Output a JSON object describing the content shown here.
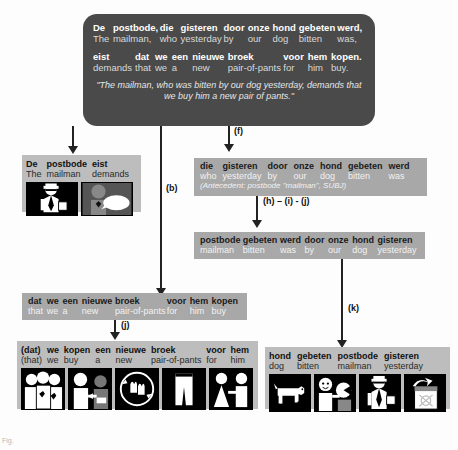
{
  "figure": {
    "caption": "Fig."
  },
  "top_box": {
    "name": "source-sentence-box",
    "line1": [
      {
        "src": "De",
        "tgt": "The"
      },
      {
        "src": "postbode,",
        "tgt": "mailman,"
      },
      {
        "src": "die",
        "tgt": "who"
      },
      {
        "src": "gisteren",
        "tgt": "yesterday"
      },
      {
        "src": "door",
        "tgt": "by"
      },
      {
        "src": "onze",
        "tgt": "our"
      },
      {
        "src": "hond",
        "tgt": "dog"
      },
      {
        "src": "gebeten",
        "tgt": "bitten"
      },
      {
        "src": "werd,",
        "tgt": "was,"
      }
    ],
    "line2": [
      {
        "src": "eist",
        "tgt": "demands"
      },
      {
        "src": "dat",
        "tgt": "that"
      },
      {
        "src": "we",
        "tgt": "we"
      },
      {
        "src": "een",
        "tgt": "a"
      },
      {
        "src": "nieuwe",
        "tgt": "new"
      },
      {
        "src": "broek",
        "tgt": "pair-of-pants"
      },
      {
        "src": "voor",
        "tgt": "for"
      },
      {
        "src": "hem",
        "tgt": "him"
      },
      {
        "src": "kopen.",
        "tgt": "buy."
      }
    ],
    "translation": "\"The mailman, who was bitten by our dog yesterday, demands that we buy him a new pair of pants.\""
  },
  "box_mailman_demands": {
    "name": "mailman-demands-panel",
    "words": [
      {
        "src": "De",
        "tgt": "The"
      },
      {
        "src": "postbode",
        "tgt": "mailman"
      },
      {
        "src": "eist",
        "tgt": "demands"
      }
    ],
    "pictograms": [
      {
        "name": "mailman-pictogram",
        "glyph": "mailman"
      },
      {
        "name": "demand-speech-pictogram",
        "glyph": "demand"
      }
    ]
  },
  "box_relative_clause": {
    "name": "relative-clause-box",
    "words": [
      {
        "src": "die",
        "tgt": "who"
      },
      {
        "src": "gisteren",
        "tgt": "yesterday"
      },
      {
        "src": "door",
        "tgt": "by"
      },
      {
        "src": "onze",
        "tgt": "our"
      },
      {
        "src": "hond",
        "tgt": "dog"
      },
      {
        "src": "gebeten",
        "tgt": "bitten"
      },
      {
        "src": "werd",
        "tgt": "was"
      }
    ],
    "note": "(Antecedent: postbode \"mailman\", SUBJ)"
  },
  "box_passive_reordered": {
    "name": "passive-reordered-box",
    "words": [
      {
        "src": "postbode",
        "tgt": "mailman"
      },
      {
        "src": "gebeten",
        "tgt": "bitten"
      },
      {
        "src": "werd",
        "tgt": "was"
      },
      {
        "src": "door",
        "tgt": "by"
      },
      {
        "src": "onze",
        "tgt": "our"
      },
      {
        "src": "hond",
        "tgt": "dog"
      },
      {
        "src": "gisteren",
        "tgt": "yesterday"
      }
    ]
  },
  "box_subclause": {
    "name": "subordinate-clause-box",
    "words": [
      {
        "src": "dat",
        "tgt": "that"
      },
      {
        "src": "we",
        "tgt": "we"
      },
      {
        "src": "een",
        "tgt": "a"
      },
      {
        "src": "nieuwe",
        "tgt": "new"
      },
      {
        "src": "broek",
        "tgt": "pair-of-pants"
      },
      {
        "src": "voor",
        "tgt": "for"
      },
      {
        "src": "hem",
        "tgt": "him"
      },
      {
        "src": "kopen",
        "tgt": "buy"
      }
    ]
  },
  "box_we_buy": {
    "name": "we-buy-pants-panel",
    "words": [
      {
        "src": "(dat)",
        "tgt": "(that)"
      },
      {
        "src": "we",
        "tgt": "we"
      },
      {
        "src": "kopen",
        "tgt": "buy"
      },
      {
        "src": "een",
        "tgt": "a"
      },
      {
        "src": "nieuwe",
        "tgt": "new"
      },
      {
        "src": "broek",
        "tgt": "pair-of-pants"
      },
      {
        "src": "voor",
        "tgt": "for"
      },
      {
        "src": "hem",
        "tgt": "him"
      }
    ],
    "pictograms": [
      {
        "name": "group-of-people-pictogram",
        "glyph": "we"
      },
      {
        "name": "buy-give-pictogram",
        "glyph": "buy"
      },
      {
        "name": "exchange-hands-pictogram",
        "glyph": "exchange"
      },
      {
        "name": "pants-pictogram",
        "glyph": "pants"
      },
      {
        "name": "for-him-pictogram",
        "glyph": "forhim"
      }
    ]
  },
  "box_dog_bit": {
    "name": "dog-bit-mailman-panel",
    "words": [
      {
        "src": "hond",
        "tgt": "dog"
      },
      {
        "src": "gebeten",
        "tgt": "bitten"
      },
      {
        "src": "postbode",
        "tgt": "mailman"
      },
      {
        "src": "gisteren",
        "tgt": "yesterday"
      }
    ],
    "pictograms": [
      {
        "name": "dog-pictogram",
        "glyph": "dog"
      },
      {
        "name": "bite-pictogram",
        "glyph": "bite"
      },
      {
        "name": "mailman-pictogram",
        "glyph": "mailman"
      },
      {
        "name": "yesterday-calendar-pictogram",
        "glyph": "calendar"
      }
    ]
  },
  "arrow_labels": {
    "b": "(b)",
    "f": "(f)",
    "hij": "(h) – (i) - (j)",
    "j": "(j)",
    "k": "(k)"
  },
  "colors": {
    "top_box_bg": "#4a4a4a",
    "gloss_bg": "#a8a8a8",
    "panel_bg": "#bdbdbd",
    "picto_bg": "#000000",
    "line": "#222222",
    "page_bg": "#fdfdfd"
  }
}
